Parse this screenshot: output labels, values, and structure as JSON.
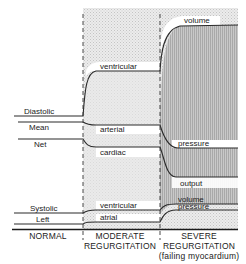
{
  "diagram": {
    "phases": [
      {
        "id": "normal",
        "label_lines": [
          "NORMAL"
        ]
      },
      {
        "id": "moderate",
        "label_lines": [
          "MODERATE",
          "REGURGITATION"
        ]
      },
      {
        "id": "severe",
        "label_lines": [
          "SEVERE",
          "REGURGITATION",
          "(failing myocardium)"
        ]
      }
    ],
    "left_labels": {
      "diastolic": "Diastolic",
      "mean": "Mean",
      "net": "Net",
      "systolic": "Systolic",
      "left": "Left"
    },
    "curve_labels": {
      "ventricular_top": "ventricular",
      "volume_top": "volume",
      "arterial": "arterial",
      "pressure_mid": "pressure",
      "cardiac": "cardiac",
      "output": "output",
      "ventricular_bottom": "ventricular",
      "volume_bottom": "volume",
      "pressure_bottom": "pressure",
      "atrial": "atrial"
    },
    "series": [
      {
        "name": "Diastolic ventricular volume",
        "normal": "baseline",
        "moderate": "increased",
        "severe": "greatly increased"
      },
      {
        "name": "Mean arterial pressure",
        "normal": "baseline",
        "moderate": "slightly decreased",
        "severe": "decreased"
      },
      {
        "name": "Net cardiac output",
        "normal": "baseline",
        "moderate": "slightly decreased",
        "severe": "greatly decreased"
      },
      {
        "name": "Systolic ventricular volume",
        "normal": "baseline",
        "moderate": "slightly increased",
        "severe": "increased"
      },
      {
        "name": "Left atrial pressure",
        "normal": "baseline",
        "moderate": "slightly increased",
        "severe": "increased"
      }
    ],
    "colors": {
      "line": "#2a2a2a",
      "shade_light": "#e6e6e6",
      "shade_dark": "#bdbdbd",
      "white": "#ffffff"
    }
  }
}
